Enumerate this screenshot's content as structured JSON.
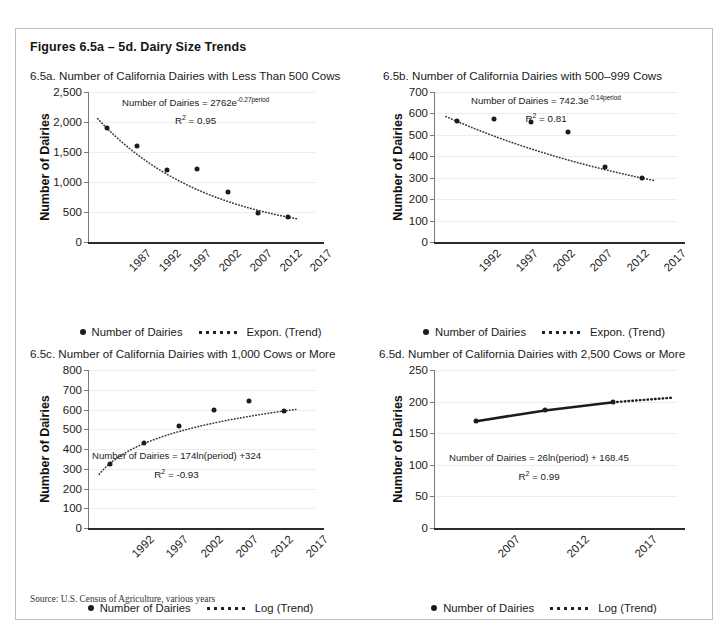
{
  "figure": {
    "title": "Figures 6.5a – 5d. Dairy Size Trends",
    "source": "Source: U.S. Census of Agriculture, various years"
  },
  "legend_labels": {
    "series": "Number of Dairies",
    "expon": "Expon. (Trend)",
    "log": "Log (Trend)"
  },
  "chart_data": [
    {
      "id": "6.5a",
      "type": "scatter",
      "title": "6.5a. Number of California Dairies with Less Than 500 Cows",
      "xlabel": "",
      "ylabel": "Number of Dairies",
      "categories": [
        "1987",
        "1992",
        "1997",
        "2002",
        "2007",
        "2012",
        "2017"
      ],
      "values": [
        1900,
        1600,
        1205,
        1220,
        830,
        490,
        415
      ],
      "ylim": [
        0,
        2500
      ],
      "yticks": [
        "0",
        "500",
        "1,000",
        "1,500",
        "2,000",
        "2,500"
      ],
      "ytick_values": [
        0,
        500,
        1000,
        1500,
        2000,
        2500
      ],
      "grid": true,
      "equation": "Number of Dairies = 2762e",
      "equation_exp": "-0.27period",
      "r2_label": "R",
      "r2_sup": "2",
      "r2_value": " = 0.95",
      "trend": {
        "kind": "exponential",
        "a": 2762,
        "b": -0.27,
        "legend": "Expon. (Trend)"
      },
      "legend_position": "bottom"
    },
    {
      "id": "6.5b",
      "type": "scatter",
      "title": "6.5b. Number of California Dairies with 500–999 Cows",
      "xlabel": "",
      "ylabel": "Number of Dairies",
      "categories": [
        "1992",
        "1997",
        "2002",
        "2007",
        "2012",
        "2017"
      ],
      "values": [
        563,
        573,
        558,
        512,
        352,
        298
      ],
      "ylim": [
        0,
        700
      ],
      "yticks": [
        "0",
        "100",
        "200",
        "300",
        "400",
        "500",
        "600",
        "700"
      ],
      "ytick_values": [
        0,
        100,
        200,
        300,
        400,
        500,
        600,
        700
      ],
      "grid": true,
      "equation": "Number of Dairies = 742.3e",
      "equation_exp": "-0.14period",
      "r2_label": "R",
      "r2_sup": "2",
      "r2_value": " = 0.81",
      "trend": {
        "kind": "exponential",
        "a": 742.3,
        "b": -0.14,
        "legend": "Expon. (Trend)"
      },
      "legend_position": "bottom"
    },
    {
      "id": "6.5c",
      "type": "scatter",
      "title": "6.5c. Number of California Dairies with 1,000 Cows or More",
      "xlabel": "",
      "ylabel": "Number of Dairies",
      "categories": [
        "1992",
        "1997",
        "2002",
        "2007",
        "2012",
        "2017"
      ],
      "values": [
        325,
        428,
        518,
        597,
        642,
        592
      ],
      "ylim": [
        0,
        800
      ],
      "yticks": [
        "0",
        "100",
        "200",
        "300",
        "400",
        "500",
        "600",
        "700",
        "800"
      ],
      "ytick_values": [
        0,
        100,
        200,
        300,
        400,
        500,
        600,
        700,
        800
      ],
      "grid": true,
      "equation": "Number of Dairies = 174ln(period) +324",
      "equation_exp": "",
      "r2_label": "R",
      "r2_sup": "2",
      "r2_value": " = -0.93",
      "trend": {
        "kind": "logarithmic",
        "a": 174,
        "b": 324,
        "legend": "Log (Trend)"
      },
      "legend_position": "bottom"
    },
    {
      "id": "6.5d",
      "type": "line",
      "title": "6.5d. Number of California Dairies with 2,500 Cows or More",
      "xlabel": "",
      "ylabel": "Number of Dairies",
      "categories": [
        "2007",
        "2012",
        "2017"
      ],
      "values": [
        169,
        186,
        199
      ],
      "ylim": [
        0,
        250
      ],
      "yticks": [
        "0",
        "50",
        "100",
        "150",
        "200",
        "250"
      ],
      "ytick_values": [
        0,
        50,
        100,
        150,
        200,
        250
      ],
      "grid": true,
      "equation": "Number of Dairies = 26ln(period) + 168.45",
      "equation_exp": "",
      "r2_label": "R",
      "r2_sup": "2",
      "r2_value": " = 0.99",
      "trend": {
        "kind": "logarithmic",
        "a": 26,
        "b": 168.45,
        "legend": "Log (Trend)"
      },
      "legend_position": "bottom"
    }
  ]
}
